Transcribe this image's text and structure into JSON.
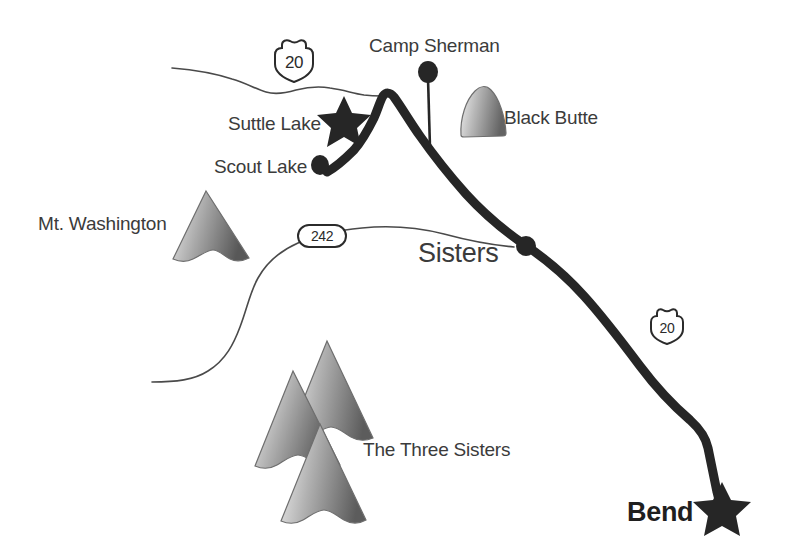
{
  "map": {
    "title": "Central Oregon Locator Map",
    "background_color": "#ffffff",
    "label_color": "#3b3b3b",
    "road_color": "#262626",
    "boundary_color": "#4a4a4a",
    "peak_light_color": "#e9e9e9",
    "peak_dark_color": "#5f5f5f",
    "width": 789,
    "height": 558
  },
  "labels": {
    "camp_sherman": "Camp Sherman",
    "black_butte": "Black Butte",
    "suttle_lake": "Suttle Lake",
    "scout_lake": "Scout Lake",
    "mt_washington": "Mt. Washington",
    "sisters": "Sisters",
    "three_sisters": "The Three Sisters",
    "bend": "Bend"
  },
  "route_shields": [
    {
      "id": "us20-north",
      "number": "20",
      "type": "us-highway-shield"
    },
    {
      "id": "or242",
      "number": "242",
      "type": "oval-state-route"
    },
    {
      "id": "us20-south",
      "number": "20",
      "type": "us-highway-shield"
    }
  ],
  "markers": [
    {
      "id": "suttle-lake",
      "kind": "star",
      "label": "Suttle Lake"
    },
    {
      "id": "scout-lake",
      "kind": "dot",
      "label": "Scout Lake"
    },
    {
      "id": "camp-sherman",
      "kind": "pin",
      "label": "Camp Sherman"
    },
    {
      "id": "sisters",
      "kind": "junction-dot",
      "label": "Sisters"
    },
    {
      "id": "bend",
      "kind": "star",
      "label": "Bend"
    }
  ],
  "mountains": [
    {
      "id": "black-butte",
      "shape": "dome",
      "label": "Black Butte"
    },
    {
      "id": "mt-washington",
      "shape": "peak",
      "label": "Mt. Washington"
    },
    {
      "id": "three-sisters-back",
      "shape": "peak",
      "label": "The Three Sisters"
    },
    {
      "id": "three-sisters-left",
      "shape": "peak",
      "label": "The Three Sisters"
    },
    {
      "id": "three-sisters-front",
      "shape": "peak",
      "label": "The Three Sisters"
    }
  ]
}
